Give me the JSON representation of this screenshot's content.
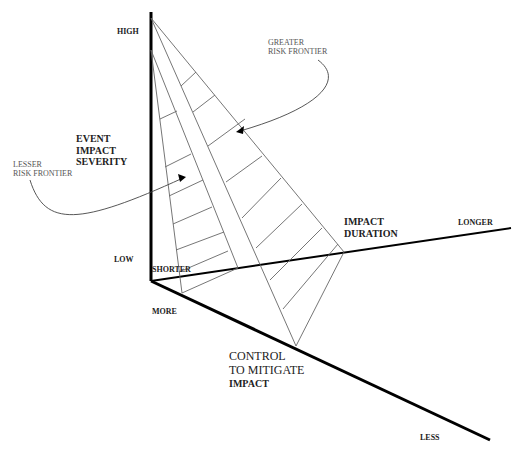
{
  "diagram": {
    "axes": {
      "severity": {
        "title": "EVENT\nIMPACT\nSEVERITY",
        "high": "HIGH",
        "low": "LOW"
      },
      "duration": {
        "title": "IMPACT\nDURATION",
        "shorter": "SHORTER",
        "longer": "LONGER"
      },
      "control": {
        "title_line1": "CONTROL",
        "title_line2": "TO MITIGATE",
        "title_line3": "IMPACT",
        "more": "MORE",
        "less": "LESS"
      }
    },
    "frontiers": {
      "greater": "GREATER\nRISK FRONTIER",
      "lesser": "LESSER\nRISK FRONTIER"
    },
    "colors": {
      "axis": "#000000",
      "grid": "#555555",
      "text": "#222222"
    }
  }
}
